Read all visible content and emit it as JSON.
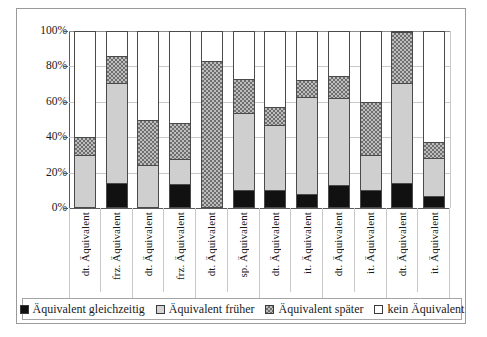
{
  "chart_data": {
    "type": "bar",
    "subtype": "stacked-bar-100-percent",
    "title": "",
    "xlabel": "",
    "ylabel": "",
    "ylim": [
      0,
      100
    ],
    "ytick_labels": [
      "0%",
      "20%",
      "40%",
      "60%",
      "80%",
      "100%"
    ],
    "ytick_values": [
      0,
      20,
      40,
      60,
      80,
      100
    ],
    "grid": true,
    "legend_position": "bottom",
    "categories": [
      "dt. Äquivalent",
      "frz. Äquivalent",
      "dt. Äquivalent",
      "frz. Äquivalent",
      "dt. Äquivalent",
      "sp. Äquivalent",
      "dt. Äquivalent",
      "it. Äquivalent",
      "dt. Äquivalent",
      "it. Äquivalent",
      "dt. Äquivalent",
      "it. Äquivalent"
    ],
    "category_lines": [
      {
        "lang": "dt.",
        "word": "Äquivalent"
      },
      {
        "lang": "frz.",
        "word": "Äquivalent"
      },
      {
        "lang": "dt.",
        "word": "Äquivalent"
      },
      {
        "lang": "frz.",
        "word": "Äquivalent"
      },
      {
        "lang": "dt.",
        "word": "Äquivalent"
      },
      {
        "lang": "sp.",
        "word": "Äquivalent"
      },
      {
        "lang": "dt.",
        "word": "Äquivalent"
      },
      {
        "lang": "it.",
        "word": "Äquivalent"
      },
      {
        "lang": "dt.",
        "word": "Äquivalent"
      },
      {
        "lang": "it.",
        "word": "Äquivalent"
      },
      {
        "lang": "dt.",
        "word": "Äquivalent"
      },
      {
        "lang": "it.",
        "word": "Äquivalent"
      }
    ],
    "groups": [
      {
        "label": "Marie",
        "span": 2
      },
      {
        "label": "Céline",
        "span": 2
      },
      {
        "label": "Arturo",
        "span": 2
      },
      {
        "label": "Aurelio",
        "span": 2
      },
      {
        "label": "Valentin",
        "span": 2
      },
      {
        "label": "Jan",
        "span": 2
      }
    ],
    "series": [
      {
        "name": "Äquivalent gleichzeitig",
        "color": "#111111",
        "pattern": "solid-black",
        "values": [
          0,
          14,
          0,
          13,
          0,
          10,
          9.5,
          7.5,
          12.5,
          10,
          14,
          6.5
        ]
      },
      {
        "name": "Äquivalent früher",
        "color": "#cfcfcf",
        "pattern": "light-gray",
        "values": [
          30,
          57,
          24,
          14.5,
          0,
          43.5,
          37.5,
          55.5,
          49.5,
          19.5,
          57,
          21.5
        ]
      },
      {
        "name": "Äquivalent später",
        "color": "#8a8a8a",
        "pattern": "checkerboard",
        "values": [
          10,
          15,
          26,
          20.5,
          83.5,
          19.5,
          10,
          9.5,
          13,
          30.5,
          29,
          9
        ]
      },
      {
        "name": "kein Äquivalent",
        "color": "#ffffff",
        "pattern": "empty",
        "values": [
          60,
          14,
          50,
          52,
          16.5,
          27,
          43,
          27.5,
          25,
          40,
          0,
          63
        ]
      }
    ],
    "cumulative_tops": [
      [
        30,
        40,
        100
      ],
      [
        14,
        71,
        86
      ],
      [
        24,
        50,
        100
      ],
      [
        13,
        27.5,
        48
      ],
      [
        0,
        83.5,
        100
      ],
      [
        10,
        53.5,
        73
      ],
      [
        9.5,
        47,
        57
      ],
      [
        7.5,
        63,
        72.5
      ],
      [
        12.5,
        62,
        75
      ],
      [
        10,
        29.5,
        60
      ],
      [
        14,
        71,
        100
      ],
      [
        6.5,
        28,
        37
      ]
    ]
  },
  "legend": {
    "items": [
      {
        "label": "Äquivalent gleichzeitig",
        "swatch": "k0"
      },
      {
        "label": "Äquivalent früher",
        "swatch": "k1"
      },
      {
        "label": "Äquivalent später",
        "swatch": "k2"
      },
      {
        "label": "kein Äquivalent",
        "swatch": "k3"
      }
    ]
  }
}
